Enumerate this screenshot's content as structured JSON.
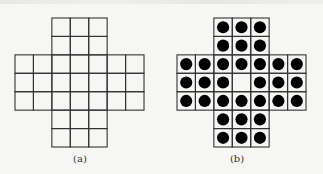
{
  "figure": {
    "subfigures": [
      {
        "id": "a",
        "caption": "(a)",
        "description": "Empty cross-shaped peg solitaire board (33 holes)",
        "origin": [
          15,
          18
        ],
        "cell": 18.43,
        "filled": []
      },
      {
        "id": "b",
        "caption": "(b)",
        "description": "Peg solitaire board filled with 32 pegs, center hole empty",
        "origin": [
          177,
          18
        ],
        "cell": 18.43,
        "empty_center": [
          3,
          3
        ]
      }
    ],
    "board_layout": [
      "..###..",
      "..###..",
      "#######",
      "#######",
      "#######",
      "..###..",
      "..###.."
    ],
    "colors": {
      "line": "#333333",
      "peg": "#000000",
      "background": "#f6f6f4"
    }
  }
}
